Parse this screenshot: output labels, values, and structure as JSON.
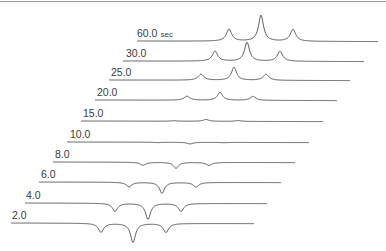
{
  "chart_data": {
    "type": "line",
    "title": "",
    "subtitle": "",
    "xlabel": "",
    "ylabel": "",
    "grid": false,
    "legend": "none",
    "time_unit": "sec",
    "series": [
      {
        "name": "60.0 sec",
        "label": "60.0 sec",
        "baseline_y": 41,
        "x_start": 137,
        "x_end": 378,
        "label_x": 137,
        "peaks": [
          {
            "x": 229,
            "amp": 12,
            "w": 3.2
          },
          {
            "x": 261,
            "amp": 26,
            "w": 3.0
          },
          {
            "x": 293,
            "amp": 12,
            "w": 3.2
          }
        ]
      },
      {
        "name": "30.0",
        "label": "30.0",
        "baseline_y": 61,
        "x_start": 123,
        "x_end": 364,
        "label_x": 126,
        "peaks": [
          {
            "x": 215,
            "amp": 10,
            "w": 3.2
          },
          {
            "x": 247,
            "amp": 19,
            "w": 3.0
          },
          {
            "x": 280,
            "amp": 10,
            "w": 3.2
          }
        ]
      },
      {
        "name": "25.0",
        "label": "25.0",
        "baseline_y": 80,
        "x_start": 109,
        "x_end": 350,
        "label_x": 111,
        "peaks": [
          {
            "x": 201,
            "amp": 6,
            "w": 3.4
          },
          {
            "x": 234,
            "amp": 13,
            "w": 3.0
          },
          {
            "x": 266,
            "amp": 6,
            "w": 3.4
          }
        ]
      },
      {
        "name": "20.0",
        "label": "20.0",
        "baseline_y": 100,
        "x_start": 95,
        "x_end": 337,
        "label_x": 97,
        "peaks": [
          {
            "x": 187,
            "amp": 4,
            "w": 3.4
          },
          {
            "x": 220,
            "amp": 8,
            "w": 3.0
          },
          {
            "x": 253,
            "amp": 4,
            "w": 3.4
          }
        ]
      },
      {
        "name": "15.0",
        "label": "15.0",
        "baseline_y": 121,
        "x_start": 81,
        "x_end": 323,
        "label_x": 83,
        "peaks": [
          {
            "x": 174,
            "amp": 0.5,
            "w": 3.4
          },
          {
            "x": 206,
            "amp": 1.8,
            "w": 3.4
          },
          {
            "x": 238,
            "amp": 0.8,
            "w": 3.4
          }
        ]
      },
      {
        "name": "10.0",
        "label": "10.0",
        "baseline_y": 142,
        "x_start": 67,
        "x_end": 309,
        "label_x": 70,
        "peaks": [
          {
            "x": 158,
            "amp": -0.4,
            "w": 3.4
          },
          {
            "x": 190,
            "amp": -1.6,
            "w": 3.4
          },
          {
            "x": 224,
            "amp": -0.3,
            "w": 3.4
          }
        ]
      },
      {
        "name": "8.0",
        "label": "8.0",
        "baseline_y": 162,
        "x_start": 53,
        "x_end": 295,
        "label_x": 55,
        "peaks": [
          {
            "x": 143,
            "amp": -3,
            "w": 3.4
          },
          {
            "x": 176,
            "amp": -6,
            "w": 3.0
          },
          {
            "x": 209,
            "amp": -3,
            "w": 3.4
          }
        ]
      },
      {
        "name": "6.0",
        "label": "6.0",
        "baseline_y": 182,
        "x_start": 39,
        "x_end": 281,
        "label_x": 41,
        "peaks": [
          {
            "x": 129,
            "amp": -4.5,
            "w": 3.4
          },
          {
            "x": 162,
            "amp": -11,
            "w": 3.0
          },
          {
            "x": 196,
            "amp": -4.5,
            "w": 3.4
          }
        ]
      },
      {
        "name": "4.0",
        "label": "4.0",
        "baseline_y": 203,
        "x_start": 25,
        "x_end": 267,
        "label_x": 26,
        "peaks": [
          {
            "x": 115,
            "amp": -8,
            "w": 3.2
          },
          {
            "x": 148,
            "amp": -16,
            "w": 3.0
          },
          {
            "x": 181,
            "amp": -8,
            "w": 3.2
          }
        ]
      },
      {
        "name": "2.0",
        "label": "2.0",
        "baseline_y": 223,
        "x_start": 11,
        "x_end": 254,
        "label_x": 12,
        "peaks": [
          {
            "x": 101,
            "amp": -9,
            "w": 3.2
          },
          {
            "x": 133,
            "amp": -19,
            "w": 3.0
          },
          {
            "x": 166,
            "amp": -9,
            "w": 3.2
          }
        ]
      }
    ],
    "summary_values": {
      "times_sec": [
        2.0,
        4.0,
        6.0,
        8.0,
        10.0,
        15.0,
        20.0,
        25.0,
        30.0,
        60.0
      ],
      "center_peak_relative_amplitude": [
        -19,
        -16,
        -11,
        -6,
        -1.6,
        1.8,
        8,
        13,
        19,
        26
      ],
      "side_peak_relative_amplitude": [
        -9,
        -8,
        -4.5,
        -3,
        -0.4,
        0.5,
        4,
        6,
        10,
        12
      ]
    }
  }
}
